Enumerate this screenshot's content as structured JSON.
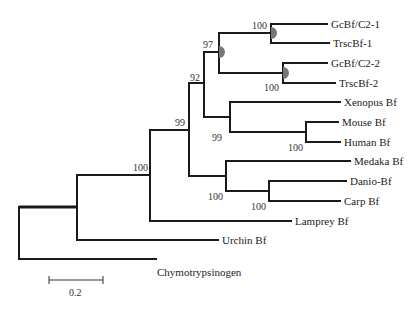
{
  "figure": {
    "type": "phylogenetic-tree",
    "colors": {
      "branch": "#1a1a1a",
      "node_marker": "#777777",
      "text": "#222222"
    }
  },
  "taxa": {
    "gcbf_c2_1": "GcBf/C2-1",
    "trscbf_1": "TrscBf-1",
    "gcbf_c2_2": "GcBf/C2-2",
    "trscbf_2": "TrscBf-2",
    "xenopus": "Xenopus Bf",
    "mouse": "Mouse Bf",
    "human": "Human Bf",
    "medaka": "Medaka Bf",
    "danio": "Danio-Bf",
    "carp": "Carp Bf",
    "lamprey": "Lamprey Bf",
    "urchin": "Urchin Bf",
    "chymo": "Chymotrypsinogen"
  },
  "bootstrap": {
    "gcbf1_trsc1": "100",
    "gcbf2_trsc2": "100",
    "shark_clade": "97",
    "tetrapod_shark": "92",
    "gnathostome": "99",
    "mammal_xenopus": "99",
    "mouse_human": "100",
    "teleost": "100",
    "danio_carp": "100",
    "vertebrate": "100"
  },
  "scale_bar": {
    "label": "0.2"
  }
}
